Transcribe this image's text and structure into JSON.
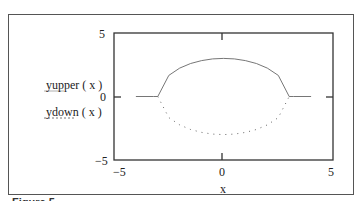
{
  "chart_data": {
    "type": "line",
    "title": "",
    "xlabel": "x",
    "ylabel": "",
    "xlim": [
      -5,
      5
    ],
    "ylim": [
      -5,
      5
    ],
    "x_ticks": [
      "-5",
      "0",
      "5"
    ],
    "y_ticks": [
      "5",
      "0",
      "-5"
    ],
    "grid": false,
    "legend_position": "left",
    "series": [
      {
        "name": "yupper ( x )",
        "style": "solid",
        "x": [
          -4,
          -3.2,
          -3,
          -2.5,
          -2,
          -1.5,
          -1,
          -0.5,
          0,
          0.5,
          1,
          1.5,
          2,
          2.5,
          3,
          3.2,
          4
        ],
        "y": [
          0,
          0,
          0,
          1.66,
          2.24,
          2.6,
          2.83,
          2.96,
          3,
          2.96,
          2.83,
          2.6,
          2.24,
          1.66,
          0,
          0,
          0
        ]
      },
      {
        "name": "ydown ( x )",
        "style": "dotted",
        "x": [
          -3,
          -2.5,
          -2,
          -1.5,
          -1,
          -0.5,
          0,
          0.5,
          1,
          1.5,
          2,
          2.5,
          3
        ],
        "y": [
          0,
          -1.66,
          -2.24,
          -2.6,
          -2.83,
          -2.96,
          -3,
          -2.96,
          -2.83,
          -2.6,
          -2.24,
          -1.66,
          0
        ]
      }
    ]
  },
  "labels": {
    "legend_upper": "yupper ( x )",
    "legend_lower": "ydown ( x )",
    "xlabel": "x",
    "y_top": "5",
    "y_mid": "0",
    "y_bottom": "−5",
    "x_left": "−5",
    "x_mid": "0",
    "x_right": "5",
    "figure_caption": "Figure 5"
  }
}
